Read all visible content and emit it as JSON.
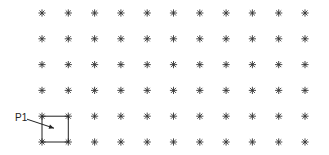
{
  "grid": {
    "columns": 11,
    "rows": 6,
    "origin_x": 42,
    "origin_y": 13,
    "step_x": 26.3,
    "step_y": 25.8,
    "marker": "asterisk",
    "marker_color": "#333333"
  },
  "selection": {
    "label": "P1",
    "col": 0,
    "row": 4,
    "width_cells": 1,
    "height_cells": 1,
    "line_color": "#222222"
  }
}
